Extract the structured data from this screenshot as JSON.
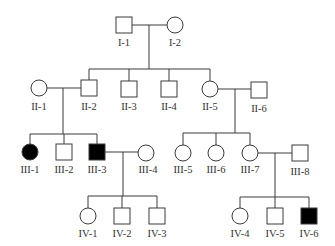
{
  "diagram": {
    "type": "pedigree",
    "colors": {
      "line": "#3a3a3a",
      "affected": "#000000",
      "unaffected": "#ffffff"
    },
    "individuals": [
      {
        "id": "I-1",
        "sex": "male",
        "affected": false,
        "label": "I-1"
      },
      {
        "id": "I-2",
        "sex": "female",
        "affected": false,
        "label": "I-2"
      },
      {
        "id": "II-1",
        "sex": "female",
        "affected": false,
        "label": "II-1"
      },
      {
        "id": "II-2",
        "sex": "male",
        "affected": false,
        "label": "II-2"
      },
      {
        "id": "II-3",
        "sex": "male",
        "affected": false,
        "label": "II-3"
      },
      {
        "id": "II-4",
        "sex": "male",
        "affected": false,
        "label": "II-4"
      },
      {
        "id": "II-5",
        "sex": "female",
        "affected": false,
        "label": "II-5"
      },
      {
        "id": "II-6",
        "sex": "male",
        "affected": false,
        "label": "II-6"
      },
      {
        "id": "III-1",
        "sex": "female",
        "affected": true,
        "label": "III-1"
      },
      {
        "id": "III-2",
        "sex": "male",
        "affected": false,
        "label": "III-2"
      },
      {
        "id": "III-3",
        "sex": "male",
        "affected": true,
        "label": "III-3"
      },
      {
        "id": "III-4",
        "sex": "female",
        "affected": false,
        "label": "III-4"
      },
      {
        "id": "III-5",
        "sex": "female",
        "affected": false,
        "label": "III-5"
      },
      {
        "id": "III-6",
        "sex": "female",
        "affected": false,
        "label": "III-6"
      },
      {
        "id": "III-7",
        "sex": "female",
        "affected": false,
        "label": "III-7"
      },
      {
        "id": "III-8",
        "sex": "male",
        "affected": false,
        "label": "III-8"
      },
      {
        "id": "IV-1",
        "sex": "female",
        "affected": false,
        "label": "IV-1"
      },
      {
        "id": "IV-2",
        "sex": "male",
        "affected": false,
        "label": "IV-2"
      },
      {
        "id": "IV-3",
        "sex": "male",
        "affected": false,
        "label": "IV-3"
      },
      {
        "id": "IV-4",
        "sex": "female",
        "affected": false,
        "label": "IV-4"
      },
      {
        "id": "IV-5",
        "sex": "male",
        "affected": false,
        "label": "IV-5"
      },
      {
        "id": "IV-6",
        "sex": "male",
        "affected": true,
        "label": "IV-6"
      }
    ],
    "couples": [
      {
        "partners": [
          "I-1",
          "I-2"
        ],
        "children": [
          "II-2",
          "II-3",
          "II-4",
          "II-5"
        ]
      },
      {
        "partners": [
          "II-1",
          "II-2"
        ],
        "children": [
          "III-1",
          "III-2",
          "III-3"
        ]
      },
      {
        "partners": [
          "II-5",
          "II-6"
        ],
        "children": [
          "III-5",
          "III-6",
          "III-7"
        ]
      },
      {
        "partners": [
          "III-3",
          "III-4"
        ],
        "children": [
          "IV-1",
          "IV-2",
          "IV-3"
        ]
      },
      {
        "partners": [
          "III-7",
          "III-8"
        ],
        "children": [
          "IV-4",
          "IV-5",
          "IV-6"
        ]
      }
    ]
  }
}
